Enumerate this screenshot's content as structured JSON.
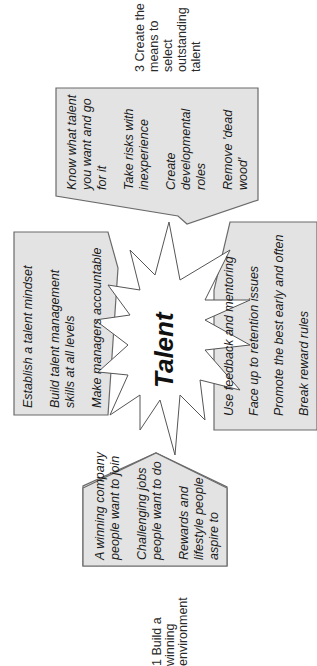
{
  "diagram": {
    "center_label": "Talent",
    "orientation": "rotated 90 degrees counter-clockwise",
    "colors": {
      "box_fill": "#e3e3e3",
      "box_stroke": "#6a6a6a",
      "star_fill": "#ffffff",
      "text": "#1a1a1a"
    },
    "section_labels": [
      {
        "id": "build",
        "lines": [
          "1 Build a",
          "winning",
          "environment"
        ]
      },
      {
        "id": "select",
        "lines": [
          "3 Create the",
          "means to",
          "select",
          "outstanding",
          "talent"
        ]
      }
    ],
    "boxes": [
      {
        "id": "mindset",
        "items": [
          {
            "lines": [
              "Establish a talent mindset"
            ]
          },
          {
            "lines": [
              "Build talent management",
              "skills at all levels"
            ]
          },
          {
            "lines": [
              "Make managers accountable"
            ]
          }
        ]
      },
      {
        "id": "select-talent",
        "items": [
          {
            "lines": [
              "Know what talent",
              "you want and go",
              "for it"
            ]
          },
          {
            "lines": [
              "Take risks with",
              "inexperience"
            ]
          },
          {
            "lines": [
              "Create",
              "developmental",
              "roles"
            ]
          },
          {
            "lines": [
              "Remove 'dead",
              "wood'"
            ]
          }
        ]
      },
      {
        "id": "develop",
        "items": [
          {
            "lines": [
              "Use feedback and mentoring"
            ]
          },
          {
            "lines": [
              "Face up to retention issues"
            ]
          },
          {
            "lines": [
              "Promote the best early and often"
            ]
          },
          {
            "lines": [
              "Break reward rules"
            ]
          }
        ]
      },
      {
        "id": "environment",
        "items": [
          {
            "lines": [
              "A winning company",
              "people want to join"
            ]
          },
          {
            "lines": [
              "Challenging jobs",
              "people want to do"
            ]
          },
          {
            "lines": [
              "Rewards and",
              "lifestyle people",
              "aspire to"
            ]
          }
        ]
      }
    ]
  }
}
